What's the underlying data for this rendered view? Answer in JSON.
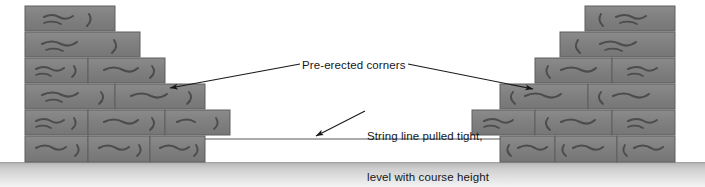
{
  "figure": {
    "type": "masonry-construction-diagram",
    "background_color": "#ffffff",
    "ground": {
      "name": "ground-line",
      "color_top": "#b9b9b9",
      "color_bottom": "#efefef",
      "y": 162,
      "height": 25
    },
    "brick": {
      "fill": "#7e7e7e",
      "fill_light": "#8a8a8a",
      "mortar": "#e8e8e8",
      "edge": "#5f5f5f",
      "texture": "#4a4a4a",
      "course_height": 26
    }
  },
  "labels": {
    "corners": {
      "text": "Pre-erected corners"
    },
    "string_line": {
      "line1": "String line pulled tight,",
      "line2": "level with course height"
    }
  },
  "annotations": {
    "leader_left": {
      "name": "leader-line-left-corner"
    },
    "leader_right": {
      "name": "leader-line-right-corner"
    },
    "leader_string": {
      "name": "leader-line-string"
    }
  },
  "string_line": {
    "name": "string-line",
    "y": 139,
    "x_start": 205,
    "x_end": 500,
    "color": "#55585c"
  },
  "left_corner": {
    "name": "left-pre-erected-corner",
    "wall_x": 25,
    "courses": [
      {
        "index": 1,
        "y": 6,
        "x_start": 25,
        "x_end": 115,
        "bricks": [
          [
            25,
            115
          ]
        ]
      },
      {
        "index": 2,
        "y": 32,
        "x_start": 25,
        "x_end": 140,
        "bricks": [
          [
            25,
            140
          ]
        ]
      },
      {
        "index": 3,
        "y": 58,
        "x_start": 25,
        "x_end": 165,
        "bricks": [
          [
            25,
            88
          ],
          [
            88,
            165
          ]
        ]
      },
      {
        "index": 4,
        "y": 84,
        "x_start": 25,
        "x_end": 205,
        "bricks": [
          [
            25,
            115
          ],
          [
            115,
            205
          ]
        ]
      },
      {
        "index": 5,
        "y": 110,
        "x_start": 25,
        "x_end": 230,
        "bricks": [
          [
            25,
            88
          ],
          [
            88,
            165
          ],
          [
            165,
            230
          ]
        ]
      },
      {
        "index": 6,
        "y": 136,
        "x_start": 25,
        "x_end": 205,
        "bricks": [
          [
            25,
            88
          ],
          [
            88,
            150
          ],
          [
            150,
            205
          ]
        ]
      }
    ]
  },
  "right_corner": {
    "name": "right-pre-erected-corner",
    "wall_x": 675,
    "courses": [
      {
        "index": 1,
        "y": 6,
        "x_start": 585,
        "x_end": 675,
        "bricks": [
          [
            585,
            675
          ]
        ]
      },
      {
        "index": 2,
        "y": 32,
        "x_start": 560,
        "x_end": 675,
        "bricks": [
          [
            560,
            675
          ]
        ]
      },
      {
        "index": 3,
        "y": 58,
        "x_start": 535,
        "x_end": 675,
        "bricks": [
          [
            535,
            612
          ],
          [
            612,
            675
          ]
        ]
      },
      {
        "index": 4,
        "y": 84,
        "x_start": 500,
        "x_end": 675,
        "bricks": [
          [
            500,
            588
          ],
          [
            588,
            675
          ]
        ]
      },
      {
        "index": 5,
        "y": 110,
        "x_start": 472,
        "x_end": 675,
        "bricks": [
          [
            472,
            535
          ],
          [
            535,
            612
          ],
          [
            612,
            675
          ]
        ]
      },
      {
        "index": 6,
        "y": 136,
        "x_start": 500,
        "x_end": 675,
        "bricks": [
          [
            500,
            555
          ],
          [
            555,
            617
          ],
          [
            617,
            675
          ]
        ]
      }
    ]
  }
}
